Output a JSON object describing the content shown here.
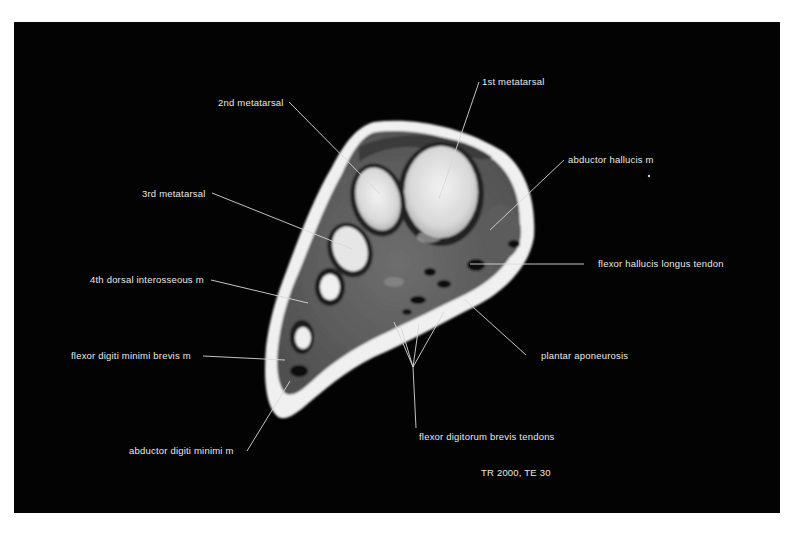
{
  "figure": {
    "sequence_label": "TR 2000, TE 30"
  },
  "labels": {
    "first_metatarsal": "1st metatarsal",
    "second_metatarsal": "2nd metatarsal",
    "third_metatarsal": "3rd metatarsal",
    "abductor_hallucis": "abductor hallucis m",
    "flexor_hallucis_longus": "flexor hallucis longus tendon",
    "fourth_dorsal_interosseous": "4th dorsal interosseous m",
    "plantar_aponeurosis": "plantar aponeurosis",
    "flexor_digiti_minimi_brevis": "flexor digiti minimi brevis m",
    "flexor_digitorum_brevis": "flexor digitorum brevis tendons",
    "abductor_digiti_minimi": "abductor digiti minimi m"
  },
  "colors": {
    "background": "#030303",
    "page": "#ffffff",
    "label_text": "#e8e8e8",
    "leader_line": "#d8d8d8"
  }
}
